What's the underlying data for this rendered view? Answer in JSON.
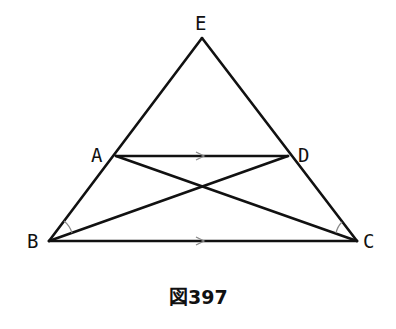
{
  "figure": {
    "caption": "図397",
    "points": {
      "E": {
        "label": "E",
        "x": 202,
        "y": 38
      },
      "A": {
        "label": "A",
        "x": 116,
        "y": 156
      },
      "D": {
        "label": "D",
        "x": 288,
        "y": 156
      },
      "B": {
        "label": "B",
        "x": 49,
        "y": 241
      },
      "C": {
        "label": "C",
        "x": 357,
        "y": 241
      }
    },
    "segments": [
      "EB",
      "EC",
      "AD",
      "BC",
      "AC",
      "DB"
    ],
    "parallel_marks": [
      "AD",
      "BC"
    ],
    "angle_marks": [
      "ABD",
      "ACD"
    ],
    "colors": {
      "stroke": "#111111",
      "mark": "#888888",
      "background": "#ffffff"
    }
  }
}
